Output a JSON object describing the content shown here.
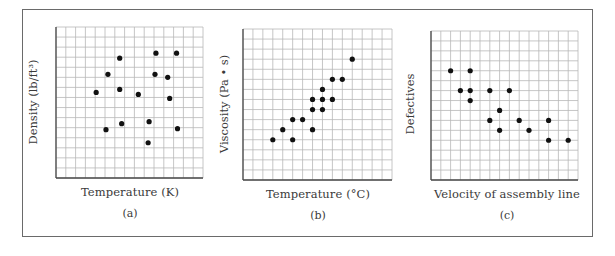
{
  "chart_data": [
    {
      "type": "scatter",
      "panel_label": "(a)",
      "xlabel": "Temperature (K)",
      "ylabel": "Density (lb/ft³)",
      "grid": true,
      "grid_cols": 15,
      "grid_rows": 15,
      "xlim": [
        0,
        15
      ],
      "ylim": [
        0,
        15
      ],
      "points": [
        [
          6.5,
          11.9
        ],
        [
          10.2,
          12.4
        ],
        [
          12.3,
          12.4
        ],
        [
          5.3,
          10.3
        ],
        [
          10.1,
          10.3
        ],
        [
          11.4,
          10.0
        ],
        [
          4.1,
          8.5
        ],
        [
          6.5,
          8.8
        ],
        [
          8.4,
          8.3
        ],
        [
          11.6,
          7.9
        ],
        [
          6.7,
          5.4
        ],
        [
          9.5,
          5.6
        ],
        [
          5.1,
          4.8
        ],
        [
          12.4,
          4.9
        ],
        [
          9.4,
          3.5
        ]
      ],
      "relationship": "no correlation"
    },
    {
      "type": "scatter",
      "panel_label": "(b)",
      "xlabel": "Temperature (°C)",
      "ylabel": "Viscosity (Pa • s)",
      "grid": true,
      "grid_cols": 15,
      "grid_rows": 15,
      "xlim": [
        0,
        15
      ],
      "ylim": [
        0,
        15
      ],
      "points": [
        [
          3,
          4
        ],
        [
          4,
          5
        ],
        [
          5,
          4
        ],
        [
          5,
          6
        ],
        [
          6,
          6
        ],
        [
          7,
          5
        ],
        [
          7,
          7
        ],
        [
          8,
          7
        ],
        [
          7,
          8
        ],
        [
          8,
          8
        ],
        [
          9,
          8
        ],
        [
          8,
          9
        ],
        [
          9,
          10
        ],
        [
          10,
          10
        ],
        [
          11,
          12
        ]
      ],
      "relationship": "positive correlation"
    },
    {
      "type": "scatter",
      "panel_label": "(c)",
      "xlabel": "Velocity of assembly line",
      "ylabel": "Defectives",
      "grid": true,
      "grid_cols": 15,
      "grid_rows": 15,
      "xlim": [
        0,
        15
      ],
      "ylim": [
        0,
        15
      ],
      "points": [
        [
          2,
          11
        ],
        [
          4,
          11
        ],
        [
          3,
          9
        ],
        [
          4,
          9
        ],
        [
          6,
          9
        ],
        [
          8,
          9
        ],
        [
          4,
          8
        ],
        [
          7,
          7
        ],
        [
          6,
          6
        ],
        [
          9,
          6
        ],
        [
          12,
          6
        ],
        [
          7,
          5
        ],
        [
          10,
          5
        ],
        [
          12,
          4
        ],
        [
          14,
          4
        ]
      ],
      "relationship": "negative correlation"
    }
  ],
  "colors": {
    "grid": "#b8b8b8",
    "axis": "#4a4a4a",
    "point": "#111111",
    "frame": "#6a6a6a"
  },
  "panels": [
    {
      "x": 56,
      "y": 27,
      "w": 147,
      "h": 151,
      "xlabel_x": 130,
      "ylabel_x": 33,
      "ylabel_cy": 102
    },
    {
      "x": 243,
      "y": 29,
      "w": 149,
      "h": 151,
      "xlabel_x": 318,
      "ylabel_x": 224,
      "ylabel_cy": 104
    },
    {
      "x": 431,
      "y": 31,
      "w": 147,
      "h": 149,
      "xlabel_x": 507,
      "ylabel_x": 410,
      "ylabel_cy": 104
    }
  ]
}
